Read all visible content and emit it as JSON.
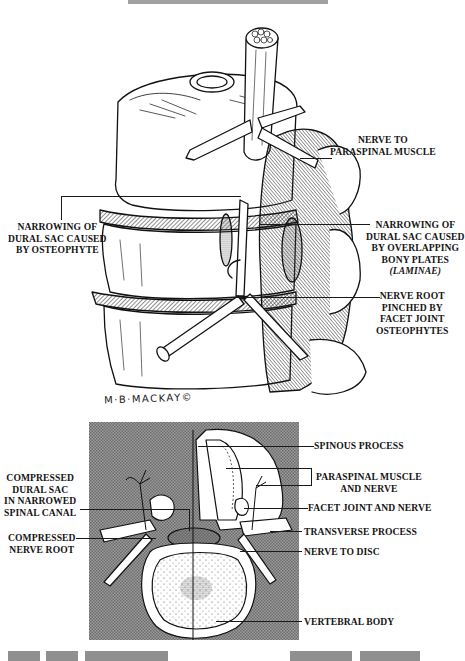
{
  "figure": {
    "title_partial": "(cut off header text)",
    "artist_signature": "M·B·MACKAY©",
    "top_illustration": {
      "description": "Lateral view of lumbar spine showing stenosis",
      "labels": [
        {
          "id": "nerve-to-paraspinal",
          "lines": [
            "NERVE TO",
            "PARASPINAL MUSCLE"
          ]
        },
        {
          "id": "narrowing-osteophyte",
          "lines": [
            "NARROWING OF",
            "DURAL SAC CAUSED",
            "BY OSTEOPHYTE"
          ]
        },
        {
          "id": "narrowing-laminae",
          "lines": [
            "NARROWING OF",
            "DURAL SAC CAUSED",
            "BY OVERLAPPING",
            "BONY PLATES",
            "(LAMINAE)"
          ]
        },
        {
          "id": "nerve-root-pinched",
          "lines": [
            "NERVE ROOT",
            "PINCHED BY",
            "FACET JOINT",
            "OSTEOPHYTES"
          ]
        }
      ]
    },
    "cross_section": {
      "description": "Axial cross-section of vertebra",
      "background_color": "#8a8a8a",
      "left_labels": [
        {
          "id": "compressed-dural-sac",
          "lines": [
            "COMPRESSED",
            "DURAL SAC",
            "IN NARROWED",
            "SPINAL CANAL"
          ]
        },
        {
          "id": "compressed-nerve-root",
          "lines": [
            "COMPRESSED",
            "NERVE ROOT"
          ]
        }
      ],
      "right_labels": [
        {
          "id": "spinous-process",
          "lines": [
            "SPINOUS PROCESS"
          ]
        },
        {
          "id": "paraspinal-muscle",
          "lines": [
            "PARASPINAL MUSCLE",
            "AND NERVE"
          ]
        },
        {
          "id": "facet-joint",
          "lines": [
            "FACET JOINT AND NERVE"
          ]
        },
        {
          "id": "transverse-process",
          "lines": [
            "TRANSVERSE PROCESS"
          ]
        },
        {
          "id": "nerve-to-disc",
          "lines": [
            "NERVE TO DISC"
          ]
        },
        {
          "id": "vertebral-body",
          "lines": [
            "VERTEBRAL BODY"
          ]
        }
      ]
    }
  }
}
